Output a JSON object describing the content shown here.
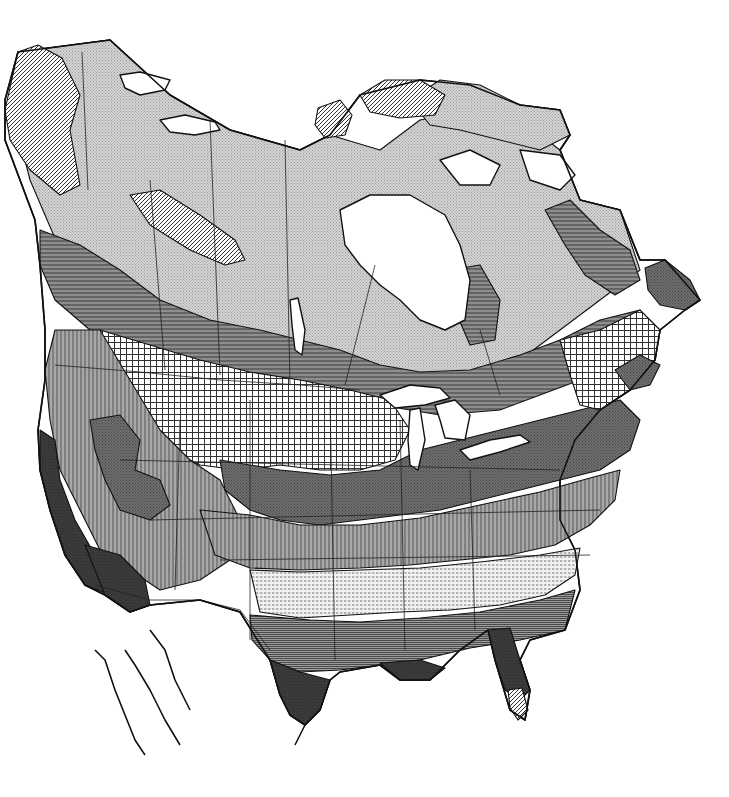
{
  "map": {
    "title": "",
    "width": 729,
    "height": 797,
    "background": "#ffffff",
    "ink": "#111111",
    "patterns": [
      {
        "id": "stipple",
        "name": "fine-stipple",
        "base": "#d4d4d4",
        "line": "#9a9a9a",
        "kind": "dots"
      },
      {
        "id": "diag",
        "name": "diagonal-hatch",
        "base": "#ffffff",
        "line": "#333333",
        "kind": "diag"
      },
      {
        "id": "hlines",
        "name": "horizontal-lines",
        "base": "#8e8e8e",
        "line": "#3a3a3a",
        "kind": "h"
      },
      {
        "id": "grid",
        "name": "crosshatch-grid",
        "base": "#ffffff",
        "line": "#333333",
        "kind": "grid"
      },
      {
        "id": "vlines",
        "name": "vertical-lines",
        "base": "#a8a8a8",
        "line": "#555555",
        "kind": "v"
      },
      {
        "id": "dark",
        "name": "dark-stipple",
        "base": "#6e6e6e",
        "line": "#444444",
        "kind": "dots"
      },
      {
        "id": "dash",
        "name": "dashed-light",
        "base": "#f2f2f2",
        "line": "#777777",
        "kind": "dash"
      },
      {
        "id": "black",
        "name": "solid-dark",
        "base": "#3c3c3c",
        "line": "#2a2a2a",
        "kind": "dots"
      },
      {
        "id": "mixed",
        "name": "horizontal-dense",
        "base": "#9c9c9c",
        "line": "#4a4a4a",
        "kind": "hdense"
      }
    ],
    "zones": [
      {
        "name": "arctic-tundra-canada",
        "pattern": "stipple",
        "d": "M18,52 L110,40 L170,95 L230,130 L300,150 L330,135 L380,150 L420,120 L470,110 L520,120 L560,150 L580,200 L620,210 L640,270 L600,300 L560,330 L520,360 L480,380 L420,390 L360,380 L300,370 L240,360 L180,330 L120,300 L60,250 L30,180 L15,120 Z"
      },
      {
        "name": "arctic-islands-north",
        "pattern": "stipple",
        "d": "M410,100 L440,80 L480,85 L520,105 L560,110 L570,135 L540,150 L500,140 L460,130 L430,125 Z"
      },
      {
        "name": "arctic-islands-hatch-1",
        "pattern": "diag",
        "d": "M360,95 L385,80 L420,80 L445,95 L435,115 L400,118 L370,112 Z"
      },
      {
        "name": "arctic-islands-hatch-2",
        "pattern": "diag",
        "d": "M318,108 L340,100 L352,115 L345,135 L325,138 L315,125 Z"
      },
      {
        "name": "alaska-yukon-hatch",
        "pattern": "diag",
        "d": "M18,52 L38,45 L62,58 L80,95 L70,130 L80,185 L60,195 L30,170 L10,140 L5,110 Z"
      },
      {
        "name": "mackenzie-hatch-band",
        "pattern": "diag",
        "d": "M130,195 L160,190 L200,215 L235,240 L245,260 L225,265 L190,250 L150,225 Z"
      },
      {
        "name": "labrador-band",
        "pattern": "hlines",
        "d": "M545,210 L570,200 L600,230 L630,250 L640,280 L615,295 L585,275 L565,245 Z"
      },
      {
        "name": "boreal-band",
        "pattern": "hlines",
        "d": "M40,230 L80,245 L120,270 L160,300 L210,320 L260,330 L300,340 L340,350 L380,365 L420,372 L470,370 L520,355 L560,340 L600,320 L640,310 L650,330 L620,360 L580,380 L540,395 L500,410 L440,415 L380,405 L330,395 L280,385 L230,375 L180,365 L130,350 L90,330 L55,300 L40,265 Z"
      },
      {
        "name": "hudson-lowland",
        "pattern": "hlines",
        "d": "M450,270 L480,265 L500,300 L495,340 L470,345 L455,310 Z"
      },
      {
        "name": "prairie-grid",
        "pattern": "grid",
        "d": "M100,330 L150,345 L200,360 L250,372 L300,380 L350,390 L390,400 L410,430 L395,460 L360,470 L320,470 L280,465 L240,470 L200,465 L170,450 L150,420 L130,390 L110,360 Z"
      },
      {
        "name": "west-mountains",
        "pattern": "vlines",
        "d": "M55,330 L100,330 L130,380 L160,430 L190,460 L220,480 L240,520 L230,560 L200,580 L160,590 L130,570 L100,550 L80,510 L60,470 L50,420 L45,370 Z"
      },
      {
        "name": "west-mountain-islands",
        "pattern": "dark",
        "d": "M90,420 L120,415 L140,440 L135,470 L160,480 L170,505 L150,520 L120,510 L105,480 L95,450 Z"
      },
      {
        "name": "midwest-dark",
        "pattern": "dark",
        "d": "M220,460 L280,470 L330,475 L380,470 L420,450 L460,440 L500,430 L540,420 L580,410 L620,400 L640,420 L630,450 L600,470 L560,480 L520,490 L480,500 L440,510 L400,515 L360,520 L320,525 L280,520 L250,510 L225,490 Z"
      },
      {
        "name": "great-plains-lines",
        "pattern": "vlines",
        "d": "M200,510 L250,515 L300,525 L360,525 L420,518 L480,505 L540,492 L590,478 L620,470 L615,500 L590,525 L555,545 L510,555 L460,560 L410,565 L360,568 L300,570 L250,568 L215,555 Z"
      },
      {
        "name": "south-light-dashed",
        "pattern": "dash",
        "d": "M250,570 L300,572 L360,570 L420,568 L480,562 L540,555 L580,548 L575,575 L545,595 L500,605 L450,610 L400,612 L350,615 L300,618 L260,612 Z"
      },
      {
        "name": "gulf-coast-lines",
        "pattern": "mixed",
        "d": "M250,615 L310,620 L360,622 L420,618 L480,612 L540,600 L575,590 L565,630 L520,640 L470,648 L420,660 L380,665 L340,670 L300,672 L270,660 L252,640 Z"
      },
      {
        "name": "texas-coast-dark",
        "pattern": "black",
        "d": "M270,660 L300,672 L330,680 L320,710 L305,725 L290,715 L280,695 Z"
      },
      {
        "name": "louisiana-coast-dark",
        "pattern": "black",
        "d": "M380,663 L420,660 L445,668 L430,680 L400,680 Z"
      },
      {
        "name": "florida-dark",
        "pattern": "black",
        "d": "M488,630 L510,628 L520,660 L530,690 L520,700 L505,690 L495,660 Z"
      },
      {
        "name": "florida-tip-hatch",
        "pattern": "diag",
        "d": "M508,690 L522,688 L528,710 L518,720 L510,708 Z"
      },
      {
        "name": "california-coast-dark",
        "pattern": "black",
        "d": "M40,430 L55,440 L60,480 L75,520 L95,555 L120,575 L110,595 L85,585 L65,555 L50,510 L40,470 Z"
      },
      {
        "name": "sonora-dark",
        "pattern": "black",
        "d": "M85,545 L120,555 L145,580 L150,605 L130,612 L105,595 Z"
      },
      {
        "name": "east-coast-grid",
        "pattern": "grid",
        "d": "M560,340 L600,330 L640,310 L660,330 L655,360 L630,390 L600,410 L580,405 L570,375 Z"
      },
      {
        "name": "newfoundland",
        "pattern": "dark",
        "d": "M645,268 L665,260 L690,280 L700,300 L685,310 L660,305 L648,290 Z"
      },
      {
        "name": "nova-scotia",
        "pattern": "dark",
        "d": "M615,370 L640,355 L660,365 L650,385 L630,390 Z"
      }
    ],
    "lakes": [
      {
        "name": "hudson-bay",
        "d": "M340,210 L370,195 L410,195 L445,215 L460,245 L470,280 L465,320 L445,330 L420,320 L400,300 L380,285 L360,265 L345,245 Z"
      },
      {
        "name": "great-bear-lake",
        "d": "M120,75 L140,72 L170,80 L165,90 L140,95 L125,88 Z"
      },
      {
        "name": "great-slave-lake",
        "d": "M160,120 L185,115 L215,122 L220,130 L195,135 L170,132 Z"
      },
      {
        "name": "lake-winnipeg",
        "d": "M290,300 L298,298 L305,330 L302,355 L295,350 L292,325 Z"
      },
      {
        "name": "lake-superior",
        "d": "M380,395 L410,385 L440,388 L450,398 L425,405 L395,408 Z"
      },
      {
        "name": "lake-michigan",
        "d": "M410,410 L420,408 L425,440 L418,470 L410,465 L408,440 Z"
      },
      {
        "name": "lake-huron",
        "d": "M435,405 L455,400 L470,415 L465,440 L445,438 L440,420 Z"
      },
      {
        "name": "lake-erie-ontario",
        "d": "M460,450 L490,440 L520,435 L530,442 L500,452 L470,460 Z"
      },
      {
        "name": "foxe-basin",
        "d": "M440,160 L470,150 L500,165 L490,185 L460,185 Z"
      },
      {
        "name": "baffin-gap",
        "d": "M520,150 L560,155 L575,175 L560,190 L530,180 Z"
      }
    ],
    "coastlines": [
      {
        "name": "baja-california-outline",
        "d": "M95,650 L105,660 L115,690 L125,715 L135,740 L145,755 M125,650 L135,665 L150,690 L165,720 L180,745 M150,630 L165,650 L175,680 L190,710"
      },
      {
        "name": "mexico-east-outline",
        "d": "M305,725 L300,735 L295,745"
      }
    ],
    "borders": [
      {
        "name": "us-canada-border",
        "d": "M55,365 L140,372 L220,380 L300,385 L360,390"
      },
      {
        "name": "alaska-yukon-border",
        "d": "M82,52 L88,190"
      },
      {
        "name": "bc-alberta-border",
        "d": "M150,180 L165,370"
      },
      {
        "name": "alberta-sask-border",
        "d": "M210,120 L220,375"
      },
      {
        "name": "sask-manitoba-border",
        "d": "M285,140 L290,385"
      },
      {
        "name": "manitoba-ontario-border",
        "d": "M375,265 L345,385"
      },
      {
        "name": "ontario-quebec-border",
        "d": "M480,330 L500,395"
      },
      {
        "name": "us-mexico-border",
        "d": "M95,585 L150,600 L200,600 L240,610 L270,650"
      },
      {
        "name": "us-state-lines-1",
        "d": "M120,460 L560,470"
      },
      {
        "name": "us-state-lines-2",
        "d": "M150,520 L600,510"
      },
      {
        "name": "us-state-lines-3",
        "d": "M220,560 L590,555"
      },
      {
        "name": "us-state-lines-4",
        "d": "M250,400 L250,640"
      },
      {
        "name": "us-state-lines-5",
        "d": "M330,400 L335,660"
      },
      {
        "name": "us-state-lines-6",
        "d": "M400,420 L405,650"
      },
      {
        "name": "us-state-lines-7",
        "d": "M470,470 L475,630"
      },
      {
        "name": "us-state-lines-8",
        "d": "M180,420 L175,590"
      }
    ],
    "outline": "M18,52 L110,40 L170,95 L230,130 L300,150 L330,135 L360,95 L420,80 L470,85 L520,105 L560,110 L570,135 L560,150 L580,200 L620,210 L640,260 L665,260 L700,300 L685,310 L660,330 L655,360 L630,390 L600,410 L575,440 L560,480 L560,520 L575,550 L580,590 L565,630 L530,640 L520,660 L530,690 L525,720 L510,710 L495,660 L488,630 L460,650 L430,680 L400,680 L380,665 L340,672 L330,680 L320,710 L305,725 L290,715 L280,695 L270,660 L240,612 L200,600 L150,605 L130,612 L105,595 L85,585 L65,555 L50,510 L40,470 L38,430 L45,380 L45,330 L40,265 L35,220 L20,180 L5,140 L5,100 Z"
  }
}
